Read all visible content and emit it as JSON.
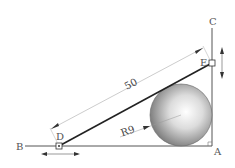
{
  "diagram": {
    "points": {
      "A": "A",
      "B": "B",
      "C": "C",
      "D": "D",
      "E": "E"
    },
    "dimension_length": "50",
    "radius_label": "R9",
    "colors": {
      "line": "#333333",
      "dim_line": "#999999",
      "sphere_light": "#ffffff",
      "sphere_dark": "#7a7a7a"
    }
  }
}
